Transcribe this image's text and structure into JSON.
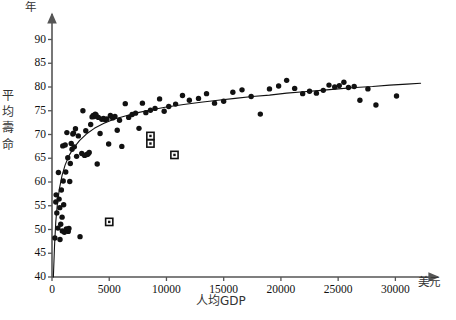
{
  "chart_data": {
    "type": "scatter",
    "title": "",
    "subtitle": "",
    "xlabel": "人均GDP",
    "ylabel": "平均壽命",
    "x_unit": "美元",
    "y_unit": "年",
    "xlim": [
      0,
      32500
    ],
    "ylim": [
      40,
      92
    ],
    "xticks": [
      0,
      5000,
      10000,
      15000,
      20000,
      25000,
      30000
    ],
    "xtick_labels": [
      "0",
      "5000",
      "10000",
      "15000",
      "20000",
      "25000",
      "30000"
    ],
    "yticks": [
      40,
      45,
      50,
      55,
      60,
      65,
      70,
      75,
      80,
      85,
      90
    ],
    "ytick_labels": [
      "40",
      "45",
      "50",
      "55",
      "60",
      "65",
      "70",
      "75",
      "80",
      "85",
      "90"
    ],
    "grid": false,
    "legend": "none",
    "axis_style": "two-axis-arrow",
    "marker_color": "#111111",
    "curve_color": "#111111",
    "axis_color": "#555555",
    "series": [
      {
        "name": "主要樣本",
        "marker": "filled-circle",
        "points": [
          [
            250,
            48.2
          ],
          [
            330,
            55.8
          ],
          [
            360,
            57.3
          ],
          [
            420,
            53.5
          ],
          [
            520,
            50.3
          ],
          [
            560,
            62.0
          ],
          [
            620,
            56.4
          ],
          [
            680,
            54.6
          ],
          [
            700,
            47.9
          ],
          [
            760,
            51.1
          ],
          [
            820,
            58.3
          ],
          [
            880,
            52.6
          ],
          [
            900,
            49.7
          ],
          [
            940,
            67.6
          ],
          [
            980,
            60.2
          ],
          [
            1020,
            55.2
          ],
          [
            1080,
            49.4
          ],
          [
            1150,
            67.8
          ],
          [
            1200,
            62.1
          ],
          [
            1250,
            50.1
          ],
          [
            1300,
            70.4
          ],
          [
            1380,
            65.1
          ],
          [
            1420,
            49.6
          ],
          [
            1480,
            50.2
          ],
          [
            1550,
            60.1
          ],
          [
            1600,
            63.9
          ],
          [
            1680,
            68.1
          ],
          [
            1750,
            66.9
          ],
          [
            1820,
            70.1
          ],
          [
            1880,
            70.3
          ],
          [
            1950,
            67.4
          ],
          [
            2050,
            71.2
          ],
          [
            2150,
            65.4
          ],
          [
            2300,
            69.7
          ],
          [
            2450,
            48.5
          ],
          [
            2600,
            66.0
          ],
          [
            2700,
            75.0
          ],
          [
            2850,
            65.6
          ],
          [
            2950,
            70.8
          ],
          [
            3050,
            65.8
          ],
          [
            3150,
            65.9
          ],
          [
            3250,
            66.2
          ],
          [
            3380,
            72.1
          ],
          [
            3500,
            73.7
          ],
          [
            3600,
            74.0
          ],
          [
            3700,
            73.8
          ],
          [
            3780,
            74.3
          ],
          [
            3850,
            74.1
          ],
          [
            3950,
            63.8
          ],
          [
            4050,
            73.6
          ],
          [
            4200,
            70.2
          ],
          [
            4350,
            73.2
          ],
          [
            4500,
            73.4
          ],
          [
            4650,
            73.1
          ],
          [
            4800,
            73.3
          ],
          [
            4950,
            68.0
          ],
          [
            5100,
            74.0
          ],
          [
            5300,
            73.5
          ],
          [
            5500,
            73.8
          ],
          [
            5700,
            70.9
          ],
          [
            5900,
            73.0
          ],
          [
            6100,
            67.5
          ],
          [
            6400,
            76.5
          ],
          [
            6700,
            73.6
          ],
          [
            7000,
            74.2
          ],
          [
            7300,
            74.5
          ],
          [
            7600,
            71.3
          ],
          [
            7900,
            76.6
          ],
          [
            8200,
            74.6
          ],
          [
            8600,
            75.1
          ],
          [
            9000,
            75.5
          ],
          [
            9400,
            77.5
          ],
          [
            9800,
            74.9
          ],
          [
            10200,
            75.9
          ],
          [
            10800,
            76.4
          ],
          [
            11400,
            78.2
          ],
          [
            12000,
            77.2
          ],
          [
            12800,
            77.6
          ],
          [
            13500,
            78.6
          ],
          [
            14200,
            76.6
          ],
          [
            15000,
            77.0
          ],
          [
            15800,
            78.9
          ],
          [
            16600,
            79.4
          ],
          [
            17400,
            78.0
          ],
          [
            18200,
            74.3
          ],
          [
            19000,
            79.6
          ],
          [
            19800,
            80.2
          ],
          [
            20500,
            81.4
          ],
          [
            21200,
            79.7
          ],
          [
            21900,
            78.6
          ],
          [
            22500,
            79.1
          ],
          [
            23100,
            78.7
          ],
          [
            23700,
            79.3
          ],
          [
            24200,
            80.4
          ],
          [
            24700,
            80.0
          ],
          [
            25100,
            80.3
          ],
          [
            25500,
            81.0
          ],
          [
            25900,
            79.9
          ],
          [
            26400,
            80.1
          ],
          [
            26900,
            77.2
          ],
          [
            27600,
            79.6
          ],
          [
            28300,
            76.2
          ],
          [
            30100,
            78.1
          ]
        ]
      },
      {
        "name": "離群樣本",
        "marker": "open-square",
        "points": [
          [
            5000,
            51.6
          ],
          [
            8600,
            69.7
          ],
          [
            8600,
            68.1
          ],
          [
            10700,
            65.7
          ]
        ]
      }
    ],
    "fit_curve": {
      "name": "對數擬合曲線",
      "style": "solid",
      "points": [
        [
          120,
          40.0
        ],
        [
          220,
          46.5
        ],
        [
          330,
          51.6
        ],
        [
          470,
          55.4
        ],
        [
          650,
          58.6
        ],
        [
          880,
          61.4
        ],
        [
          1150,
          63.6
        ],
        [
          1500,
          65.6
        ],
        [
          1900,
          67.2
        ],
        [
          2400,
          68.7
        ],
        [
          3000,
          70.1
        ],
        [
          3700,
          71.3
        ],
        [
          4500,
          72.3
        ],
        [
          5400,
          73.2
        ],
        [
          6400,
          73.9
        ],
        [
          7500,
          74.6
        ],
        [
          8700,
          75.2
        ],
        [
          10000,
          75.8
        ],
        [
          11500,
          76.3
        ],
        [
          13000,
          76.8
        ],
        [
          14500,
          77.2
        ],
        [
          16000,
          77.6
        ],
        [
          17500,
          78.0
        ],
        [
          19000,
          78.3
        ],
        [
          20500,
          78.7
        ],
        [
          22000,
          79.0
        ],
        [
          23500,
          79.3
        ],
        [
          25000,
          79.6
        ],
        [
          26500,
          79.9
        ],
        [
          28000,
          80.1
        ],
        [
          29500,
          80.4
        ],
        [
          31000,
          80.6
        ],
        [
          32200,
          80.8
        ]
      ]
    }
  }
}
